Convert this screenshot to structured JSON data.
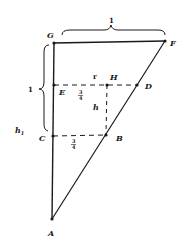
{
  "diagram": {
    "points": {
      "A": {
        "label": "A",
        "x": 52,
        "y": 219
      },
      "B": {
        "label": "B",
        "x": 106,
        "y": 135
      },
      "C": {
        "label": "C",
        "x": 53,
        "y": 136
      },
      "D": {
        "label": "D",
        "x": 137,
        "y": 85
      },
      "E": {
        "label": "E",
        "x": 54,
        "y": 85
      },
      "F": {
        "label": "F",
        "x": 165,
        "y": 41
      },
      "G": {
        "label": "G",
        "x": 54,
        "y": 43
      },
      "H": {
        "label": "H",
        "x": 107,
        "y": 85
      }
    },
    "segments_solid": [
      "G-F",
      "G-A",
      "A-F"
    ],
    "segments_dashed": [
      "E-D",
      "C-B",
      "H-B"
    ],
    "annotations": {
      "top_brace_label": "1",
      "left_brace_label": "1",
      "h1_label": "h",
      "h1_sub": "1",
      "h_label": "h",
      "r_label": "r",
      "frac_upper_num": "3",
      "frac_upper_den": "4",
      "frac_lower_num": "3",
      "frac_lower_den": "4"
    },
    "colors": {
      "ink": "#1a1a1a",
      "background": "#ffffff"
    }
  }
}
